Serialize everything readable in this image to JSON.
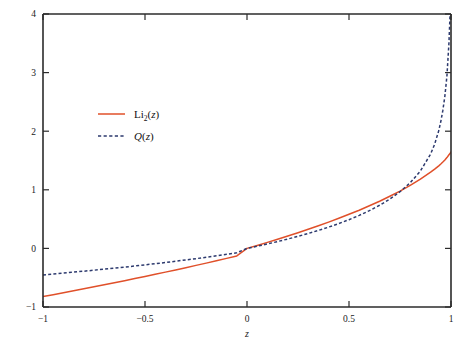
{
  "figure": {
    "background_color": "#ffffff",
    "frame_color": "#2b2b2b"
  },
  "axes": {
    "x": {
      "label": "z",
      "min": -1,
      "max": 1,
      "ticks": [
        -1,
        -0.5,
        0,
        0.5,
        1
      ],
      "tick_labels": [
        "−1",
        "−0.5",
        "0",
        "0.5",
        "1"
      ]
    },
    "y": {
      "label": "",
      "min": -1,
      "max": 4,
      "ticks": [
        -1,
        0,
        1,
        2,
        3,
        4
      ],
      "tick_labels": [
        "−1",
        "0",
        "1",
        "2",
        "3",
        "4"
      ]
    }
  },
  "legend": {
    "position": "upper-left",
    "entries": [
      {
        "key": "li2",
        "label_prefix": "Li",
        "label_sub": "2",
        "label_suffix_open": "(",
        "label_var": "z",
        "label_suffix_close": ")",
        "label_plain": "Li2(z)",
        "color": "#e0502a",
        "style": "solid"
      },
      {
        "key": "q",
        "label_prefix": "",
        "label_sub": "",
        "label_suffix_open": "(",
        "label_var": "z",
        "label_suffix_close": ")",
        "label_head": "Q",
        "label_plain": "Q(z)",
        "color": "#2d3a6e",
        "style": "dashed"
      }
    ]
  },
  "chart_data": {
    "type": "line",
    "title": "",
    "xlabel": "z",
    "ylabel": "",
    "xlim": [
      -1,
      1
    ],
    "ylim": [
      -1,
      4
    ],
    "grid": false,
    "legend_position": "upper-left",
    "x": [
      -1.0,
      -0.95,
      -0.9,
      -0.85,
      -0.8,
      -0.75,
      -0.7,
      -0.65,
      -0.6,
      -0.55,
      -0.5,
      -0.45,
      -0.4,
      -0.35,
      -0.3,
      -0.25,
      -0.2,
      -0.15,
      -0.1,
      -0.05,
      0.0,
      0.05,
      0.1,
      0.15,
      0.2,
      0.25,
      0.3,
      0.35,
      0.4,
      0.45,
      0.5,
      0.55,
      0.6,
      0.65,
      0.7,
      0.75,
      0.8,
      0.85,
      0.9,
      0.92,
      0.94,
      0.95,
      0.96,
      0.97,
      0.98,
      0.99,
      0.995,
      1.0
    ],
    "series": [
      {
        "name": "Li2(z)",
        "color": "#e0502a",
        "style": "solid",
        "values": [
          -0.822,
          -0.79,
          -0.757,
          -0.724,
          -0.69,
          -0.656,
          -0.621,
          -0.586,
          -0.551,
          -0.515,
          -0.479,
          -0.442,
          -0.405,
          -0.367,
          -0.329,
          -0.29,
          -0.251,
          -0.211,
          -0.17,
          -0.128,
          0.0,
          0.051,
          0.103,
          0.156,
          0.211,
          0.268,
          0.326,
          0.387,
          0.449,
          0.514,
          0.582,
          0.652,
          0.727,
          0.805,
          0.889,
          0.978,
          1.075,
          1.182,
          1.3,
          1.352,
          1.409,
          1.44,
          1.473,
          1.509,
          1.55,
          1.599,
          1.617,
          1.645
        ]
      },
      {
        "name": "Q(z)",
        "color": "#2d3a6e",
        "style": "dashed",
        "values": [
          -0.452,
          -0.437,
          -0.421,
          -0.405,
          -0.389,
          -0.372,
          -0.355,
          -0.337,
          -0.319,
          -0.3,
          -0.281,
          -0.261,
          -0.241,
          -0.219,
          -0.197,
          -0.175,
          -0.151,
          -0.126,
          -0.101,
          -0.074,
          0.0,
          0.037,
          0.076,
          0.117,
          0.16,
          0.206,
          0.255,
          0.307,
          0.363,
          0.424,
          0.49,
          0.563,
          0.644,
          0.736,
          0.842,
          0.967,
          1.12,
          1.32,
          1.61,
          1.78,
          2.01,
          2.165,
          2.355,
          2.6,
          2.94,
          3.51,
          3.96,
          4.0
        ]
      }
    ],
    "annotations": [
      {
        "text": "curves intersect near z = 0.68, value = 0.95"
      }
    ]
  }
}
